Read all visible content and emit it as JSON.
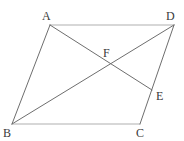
{
  "figure": {
    "canvas": {
      "width": 184,
      "height": 141,
      "background": "#ffffff"
    },
    "colors": {
      "outline_light": "#b0b0b0",
      "outline_dark": "#6e6e6e",
      "label": "#3a3a3a"
    },
    "points": [
      {
        "id": "A",
        "label": "A",
        "x": 50,
        "y": 25,
        "label_x": 42,
        "label_y": 10
      },
      {
        "id": "D",
        "label": "D",
        "x": 174,
        "y": 25,
        "label_x": 166,
        "label_y": 10
      },
      {
        "id": "B",
        "label": "B",
        "x": 12,
        "y": 124,
        "label_x": 3,
        "label_y": 127
      },
      {
        "id": "C",
        "label": "C",
        "x": 140,
        "y": 124,
        "label_x": 136,
        "label_y": 127
      },
      {
        "id": "E",
        "label": "E",
        "x": 152,
        "y": 90,
        "label_x": 156,
        "label_y": 90
      },
      {
        "id": "F",
        "label": "F",
        "x": 108,
        "y": 64,
        "label_x": 103,
        "label_y": 47
      }
    ],
    "segments": [
      {
        "id": "AD",
        "from": "A",
        "to": "D",
        "style": "light"
      },
      {
        "id": "BC",
        "from": "B",
        "to": "C",
        "style": "light"
      },
      {
        "id": "AB",
        "from": "A",
        "to": "B",
        "style": "dark"
      },
      {
        "id": "DC",
        "from": "D",
        "to": "C",
        "style": "dark"
      },
      {
        "id": "BD",
        "from": "B",
        "to": "D",
        "style": "dark"
      },
      {
        "id": "AE",
        "from": "A",
        "to": "E",
        "style": "dark"
      }
    ]
  }
}
